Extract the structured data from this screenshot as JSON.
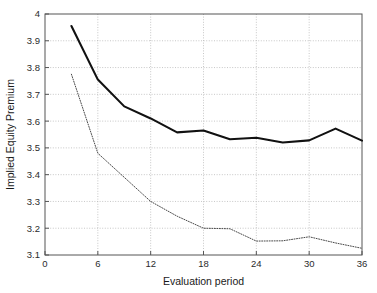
{
  "figure": {
    "background_color": "#ffffff",
    "plot_area": {
      "left": 45,
      "top": 14,
      "right": 362,
      "bottom": 255
    },
    "axis_color": "#555555",
    "grid_color": "#b9b9b9"
  },
  "chart_data": {
    "type": "line",
    "title": "",
    "subtitle": "",
    "xlabel": "Evaluation period",
    "ylabel": "Implied Equity Premium",
    "xlim": [
      0,
      36
    ],
    "ylim": [
      3.1,
      4.0
    ],
    "xticks": [
      0,
      6,
      12,
      18,
      24,
      30,
      36
    ],
    "xtick_labels": [
      "0",
      "6",
      "12",
      "18",
      "24",
      "30",
      "36"
    ],
    "yticks": [
      3.1,
      3.2,
      3.3,
      3.4,
      3.5,
      3.6,
      3.7,
      3.8,
      3.9,
      4.0
    ],
    "ytick_labels": [
      "3.1",
      "3.2",
      "3.3",
      "3.4",
      "3.5",
      "3.6",
      "3.7",
      "3.8",
      "3.9",
      "4"
    ],
    "grid": true,
    "grid_style": "dotted",
    "legend": false,
    "legend_position": "none",
    "annotations": [],
    "x": [
      3,
      6,
      9,
      12,
      15,
      18,
      21,
      24,
      27,
      30,
      33,
      36
    ],
    "series": [
      {
        "name": "solid-series",
        "style": "solid",
        "color": "#111111",
        "width": 2.1,
        "values": [
          3.955,
          3.755,
          3.655,
          3.61,
          3.558,
          3.565,
          3.532,
          3.538,
          3.52,
          3.528,
          3.572,
          3.527
        ]
      },
      {
        "name": "dotted-series",
        "style": "dotted",
        "color": "#4a4a4a",
        "width": 1.0,
        "values": [
          3.775,
          3.48,
          3.39,
          3.3,
          3.245,
          3.2,
          3.198,
          3.152,
          3.153,
          3.168,
          3.145,
          3.125
        ]
      }
    ]
  }
}
